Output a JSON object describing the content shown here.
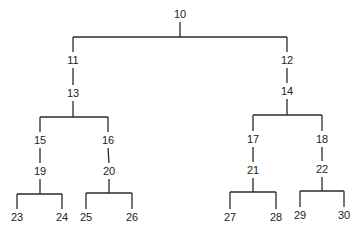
{
  "diagram": {
    "type": "tree",
    "root": "10",
    "nodes": [
      {
        "id": "10",
        "label": "10",
        "x": 180,
        "y": 14
      },
      {
        "id": "11",
        "label": "11",
        "x": 73,
        "y": 60
      },
      {
        "id": "12",
        "label": "12",
        "x": 287,
        "y": 60
      },
      {
        "id": "13",
        "label": "13",
        "x": 73,
        "y": 93
      },
      {
        "id": "14",
        "label": "14",
        "x": 287,
        "y": 91
      },
      {
        "id": "15",
        "label": "15",
        "x": 40,
        "y": 140
      },
      {
        "id": "16",
        "label": "16",
        "x": 108,
        "y": 140
      },
      {
        "id": "17",
        "label": "17",
        "x": 253,
        "y": 139
      },
      {
        "id": "18",
        "label": "18",
        "x": 322,
        "y": 139
      },
      {
        "id": "19",
        "label": "19",
        "x": 40,
        "y": 171
      },
      {
        "id": "20",
        "label": "20",
        "x": 109,
        "y": 171
      },
      {
        "id": "21",
        "label": "21",
        "x": 253,
        "y": 170
      },
      {
        "id": "22",
        "label": "22",
        "x": 322,
        "y": 169
      },
      {
        "id": "23",
        "label": "23",
        "x": 17,
        "y": 217
      },
      {
        "id": "24",
        "label": "24",
        "x": 62,
        "y": 217
      },
      {
        "id": "25",
        "label": "25",
        "x": 86,
        "y": 217
      },
      {
        "id": "26",
        "label": "26",
        "x": 132,
        "y": 217
      },
      {
        "id": "27",
        "label": "27",
        "x": 230,
        "y": 217
      },
      {
        "id": "28",
        "label": "28",
        "x": 276,
        "y": 217
      },
      {
        "id": "29",
        "label": "29",
        "x": 300,
        "y": 215
      },
      {
        "id": "30",
        "label": "30",
        "x": 344,
        "y": 215
      }
    ],
    "edges": [
      {
        "from": "10",
        "to": "11"
      },
      {
        "from": "10",
        "to": "12"
      },
      {
        "from": "11",
        "to": "13"
      },
      {
        "from": "12",
        "to": "14"
      },
      {
        "from": "13",
        "to": "15"
      },
      {
        "from": "13",
        "to": "16"
      },
      {
        "from": "14",
        "to": "17"
      },
      {
        "from": "14",
        "to": "18"
      },
      {
        "from": "15",
        "to": "19"
      },
      {
        "from": "16",
        "to": "20"
      },
      {
        "from": "17",
        "to": "21"
      },
      {
        "from": "18",
        "to": "22"
      },
      {
        "from": "19",
        "to": "23"
      },
      {
        "from": "19",
        "to": "24"
      },
      {
        "from": "20",
        "to": "25"
      },
      {
        "from": "20",
        "to": "26"
      },
      {
        "from": "21",
        "to": "27"
      },
      {
        "from": "21",
        "to": "28"
      },
      {
        "from": "22",
        "to": "29"
      },
      {
        "from": "22",
        "to": "30"
      }
    ],
    "branch_bars": [
      {
        "parent": "10",
        "bar_y": 37
      },
      {
        "parent": "13",
        "bar_y": 117
      },
      {
        "parent": "14",
        "bar_y": 115
      },
      {
        "parent": "19",
        "bar_y": 194
      },
      {
        "parent": "20",
        "bar_y": 193
      },
      {
        "parent": "21",
        "bar_y": 192
      },
      {
        "parent": "22",
        "bar_y": 191
      }
    ],
    "colors": {
      "line": "#2a2a2a",
      "text": "#222222",
      "background": "#ffffff"
    }
  }
}
